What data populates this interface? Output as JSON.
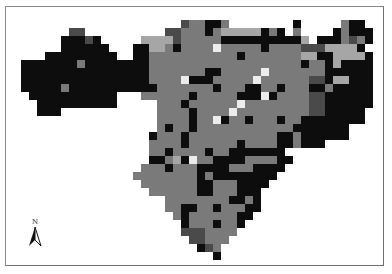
{
  "map": {
    "title": "",
    "cell_size_px": 8,
    "columns": 44,
    "rows_count": 30,
    "legend_codes": {
      ".": "empty",
      "K": "black",
      "D": "dark-gray",
      "M": "medium-gray",
      "L": "light-gray",
      "W": "white"
    },
    "palette": {
      ".": "transparent",
      "K": "#0d0d0d",
      "D": "#4a4a4a",
      "M": "#7a7a7a",
      "L": "#a6a6a6",
      "W": "#ececec"
    },
    "grid": [
      "....................DMMKKM........K.....MKK.",
      "......DD..........DDMMMKMLLLLLKMK.M....KMKKK",
      ".....KKKDK.....LLLLDMMMMMKKKKKKKKKKL.KKKMDMKK",
      ".....KKKKKK...KKLLMKMMMMWMMMMMKMMMMDDDLLLLK",
      "...KKKKKKKKK..KKMMMMMMMMMMMKMMMMMMMLLKKLLLLK",
      "KKKKKKKMKKKKKKKKMMMMMMMMMMMMMMMMMMMKMMKLKKKK",
      "KKKKKKKKKKKKKKKKMMMMMMMKKMMMMMWMMMMMMMKKKKKK",
      "KKKKKKKKKKKKKKKKMMMMWKKKMMMMMWMMMMMMDDKLLKKK",
      "KKKKKMKKKKKKKKKKKMMMMMMMKMMMKKMMKMMMKKMKKKKK",
      ".KKKKKKKKKKK...MMMMMMKMMMMMKKKWKMMMMDDKKKKKK",
      "..KKKKKKKKKK.....MMMKMMMMMMWMMMMMMMMDDKKKKKK",
      "..KKK............MMMMKMMMMWMMMMMMMMMDDKKKKK.",
      ".................MMMMKMMWKMMKMMMKMMKKKKKKKK.",
      ".................MKMMKMMMMMMMMMMMMKKKKKKK...",
      "................KMMMKMMMMMMMMMMMKKMKKKKKK...",
      "................MMMMKMMMMMMKMMMMKKMKKK......",
      "................MMKMMMMKMMKKKKKKK...........",
      "................KKMLKWMMKKKKMMMMKK..........",
      "...............MMMKMMMKKKKMMMKKKK...........",
      "..............MMMMMMMMKMKKKKKKKK............",
      "...............MMMMMMMKKMMMKKKK.............",
      "................MMMMMMKKMMMKKK..............",
      "..................MMMMMMMMKKMK..............",
      "..................MMKKMMKMMMKK..............",
      "...................MKMMMMMMKK...............",
      "....................KMMMKMMK................",
      "....................DDDMMMM.................",
      ".....................DDMMM..................",
      "......................KDM...................",
      "........................K..................."
    ]
  },
  "north_arrow": {
    "label": "N"
  },
  "caption": {
    "text": ""
  }
}
